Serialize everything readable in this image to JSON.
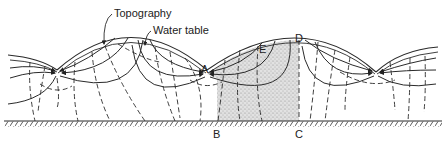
{
  "diagram": {
    "type": "groundwater-flow-net",
    "labels": {
      "topography": "Topography",
      "water_table": "Water table",
      "point_a": "A",
      "point_b": "B",
      "point_c": "C",
      "point_d": "D",
      "point_e": "E"
    },
    "legend_meaning": {
      "solid_lines": "flow lines",
      "dashed_lines": "equipotential lines",
      "stippled_region": "flow cell bounded by A-B-C-D",
      "hatched_line": "impermeable base"
    },
    "colors": {
      "ink": "#2a2a2a",
      "stipple": "#9a9a9a",
      "background": "#ffffff"
    }
  }
}
